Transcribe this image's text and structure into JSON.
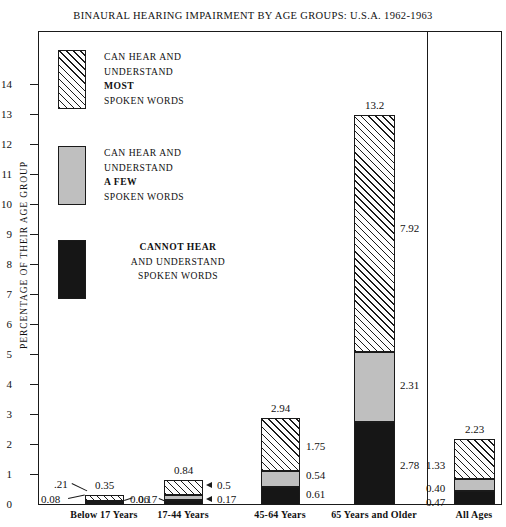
{
  "chart_data": {
    "type": "bar",
    "subtype": "stacked-bar",
    "title": "BINAURAL HEARING IMPAIRMENT BY AGE GROUPS:  U.S.A. 1962-1963",
    "xlabel": "",
    "ylabel": "PERCENTAGE OF THEIR AGE GROUP",
    "ylim": [
      0,
      14.4
    ],
    "yticks": [
      0,
      1,
      2,
      3,
      4,
      5,
      6,
      7,
      8,
      9,
      10,
      11,
      12,
      13,
      14
    ],
    "ytick_labels": [
      "0",
      "1",
      "2",
      "3",
      "4",
      "5",
      "6",
      "7",
      "8",
      "9",
      "10",
      "11",
      "12",
      "13",
      "14"
    ],
    "grid": false,
    "legend_position": "upper-left-inside",
    "categories": [
      "Below 17 Years",
      "17-44 Years",
      "45-64 Years",
      "65 Years and Older",
      "All Ages"
    ],
    "series": [
      {
        "name": "CAN HEAR AND UNDERSTAND MOST SPOKEN WORDS",
        "fill": "diagonal-hatch",
        "values": [
          0.21,
          0.5,
          1.75,
          7.92,
          1.33
        ]
      },
      {
        "name": "CAN HEAR AND UNDERSTAND A FEW SPOKEN WORDS",
        "fill": "gray",
        "values": [
          0.06,
          0.17,
          0.54,
          2.31,
          0.4
        ]
      },
      {
        "name": "CANNOT HEAR AND UNDERSTAND SPOKEN WORDS",
        "fill": "black",
        "values": [
          0.08,
          0.17,
          0.61,
          2.78,
          0.47
        ]
      }
    ],
    "totals": [
      0.35,
      0.84,
      2.94,
      13.2,
      2.23
    ],
    "total_labels": [
      "0.35",
      "0.84",
      "2.94",
      "13.2",
      "2.23"
    ],
    "segment_labels": {
      "most": [
        ".21",
        "0.5",
        "1.75",
        "7.92",
        "1.33"
      ],
      "few": [
        "0.06",
        "0.17",
        "0.54",
        "2.31",
        "0.40"
      ],
      "none": [
        "0.08",
        "0.17",
        "0.61",
        "2.78",
        "0.47"
      ]
    }
  },
  "legend": {
    "items": [
      {
        "swatch": "hatched-swatch",
        "lines": [
          "CAN HEAR AND",
          "UNDERSTAND",
          "MOST",
          "SPOKEN WORDS"
        ],
        "bold_line_index": 2
      },
      {
        "swatch": "gray-swatch",
        "lines": [
          "CAN HEAR AND",
          "UNDERSTAND",
          "A FEW",
          "SPOKEN WORDS"
        ],
        "bold_line_index": 2
      },
      {
        "swatch": "black-swatch",
        "lines": [
          "CANNOT HEAR",
          "AND UNDERSTAND",
          "SPOKEN WORDS"
        ],
        "bold_line_index": 0
      }
    ]
  },
  "colors": {
    "ink": "#1a1a1a",
    "gray_fill": "#bfbfbf",
    "black_fill": "#161616",
    "background": "#ffffff"
  }
}
